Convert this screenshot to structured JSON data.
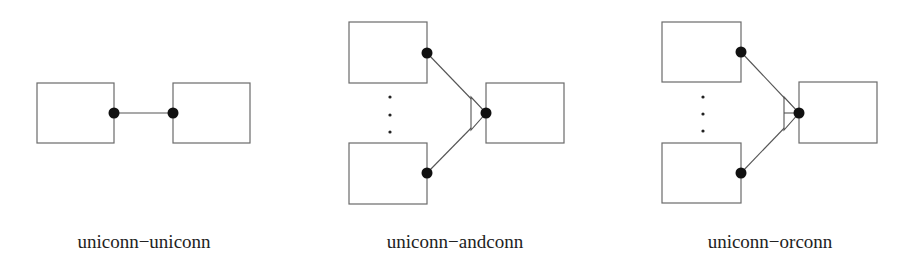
{
  "diagram": {
    "type": "connector-notation",
    "panels": [
      {
        "id": "uniconn-uniconn",
        "caption": "uniconn−uniconn",
        "description": "Two boxes joined by a single line between two filled uni-connector ports"
      },
      {
        "id": "uniconn-andconn",
        "caption": "uniconn−andconn",
        "description": "Multiple source boxes (with ellipsis) connected via uni-connector ports to an AND-connector (open triangle) on a target box"
      },
      {
        "id": "uniconn-orconn",
        "caption": "uniconn−orconn",
        "description": "Multiple source boxes (with ellipsis) connected via uni-connector ports to an OR-connector (open triangle with inner bar) on a target box"
      }
    ],
    "colors": {
      "box_stroke": "#6a6a6a",
      "wire": "#555555",
      "port_fill": "#111111",
      "text": "#222222",
      "background": "#ffffff"
    }
  }
}
